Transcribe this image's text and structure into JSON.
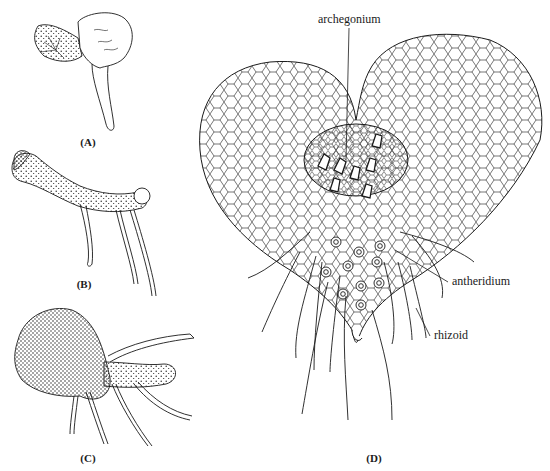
{
  "figure": {
    "panels": [
      {
        "id": "A",
        "label": "(A)",
        "description": "early gametophyte with developing prothallus and single rhizoid"
      },
      {
        "id": "B",
        "label": "(B)",
        "description": "elongated filamentous gametophyte with rhizoids"
      },
      {
        "id": "C",
        "label": "(C)",
        "description": "broadened gametophyte with multiple rhizoids"
      },
      {
        "id": "D",
        "label": "(D)",
        "description": "mature heart-shaped prothallus"
      }
    ],
    "annotations": {
      "archegonium": "archegonium",
      "antheridium": "antheridium",
      "rhizoid": "rhizoid"
    },
    "colors": {
      "ink": "#1a1a1a",
      "background": "#ffffff"
    }
  }
}
